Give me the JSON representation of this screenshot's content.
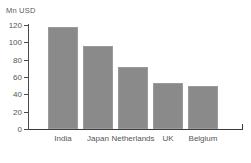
{
  "chart_data": {
    "type": "bar",
    "title": "",
    "subtitle": "",
    "unit_label": "Mn USD",
    "xlabel": "",
    "ylabel": "Mn USD",
    "categories": [
      "India",
      "Japan",
      "Netherlands",
      "UK",
      "Belgium"
    ],
    "values": [
      118,
      96,
      71,
      53,
      50
    ],
    "ylim": [
      0,
      120
    ],
    "ytick_values": [
      0,
      20,
      40,
      60,
      80,
      100,
      120
    ],
    "ytick_labels": [
      "0",
      "20",
      "40",
      "60",
      "80",
      "100",
      "120"
    ],
    "grid": false,
    "legend": false,
    "legend_position": "none",
    "series": [
      {
        "name": "Mn USD",
        "values": [
          118,
          96,
          71,
          53,
          50
        ]
      }
    ],
    "colors": {
      "bar_fill": "#8a8a8a",
      "bar_stroke": "#9b9b9b",
      "axis": "#3c3c3c",
      "text": "#555555",
      "background": "#ffffff"
    }
  }
}
